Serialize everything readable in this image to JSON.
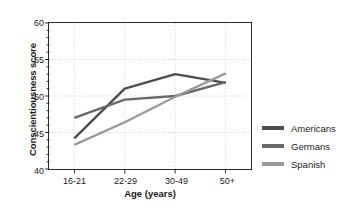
{
  "chart_data": {
    "type": "line",
    "title": "",
    "xlabel": "Age (years)",
    "ylabel": "Conscientiousness score",
    "categories": [
      "16-21",
      "22-29",
      "30-49",
      "50+"
    ],
    "ylim": [
      40,
      60
    ],
    "yticks": [
      40,
      45,
      50,
      55,
      60
    ],
    "grid": true,
    "legend_position": "right",
    "series": [
      {
        "name": "Americans",
        "color": "#4d4d4d",
        "values": [
          44.2,
          51.0,
          53.0,
          51.8
        ]
      },
      {
        "name": "Germans",
        "color": "#696969",
        "values": [
          47.0,
          49.5,
          50.0,
          51.9
        ]
      },
      {
        "name": "Spanish",
        "color": "#9a9a9a",
        "values": [
          43.3,
          46.4,
          49.9,
          53.1
        ]
      }
    ]
  },
  "axis": {
    "y_tick_labels": [
      "40",
      "45",
      "50",
      "55",
      "60"
    ],
    "x_tick_labels": [
      "16-21",
      "22-29",
      "30-49",
      "50+"
    ],
    "y_title": "Conscientiousness score",
    "x_title": "Age (years)"
  },
  "legend": {
    "items": [
      {
        "label": "Americans",
        "color": "#4d4d4d"
      },
      {
        "label": "Germans",
        "color": "#696969"
      },
      {
        "label": "Spanish",
        "color": "#9a9a9a"
      }
    ]
  }
}
